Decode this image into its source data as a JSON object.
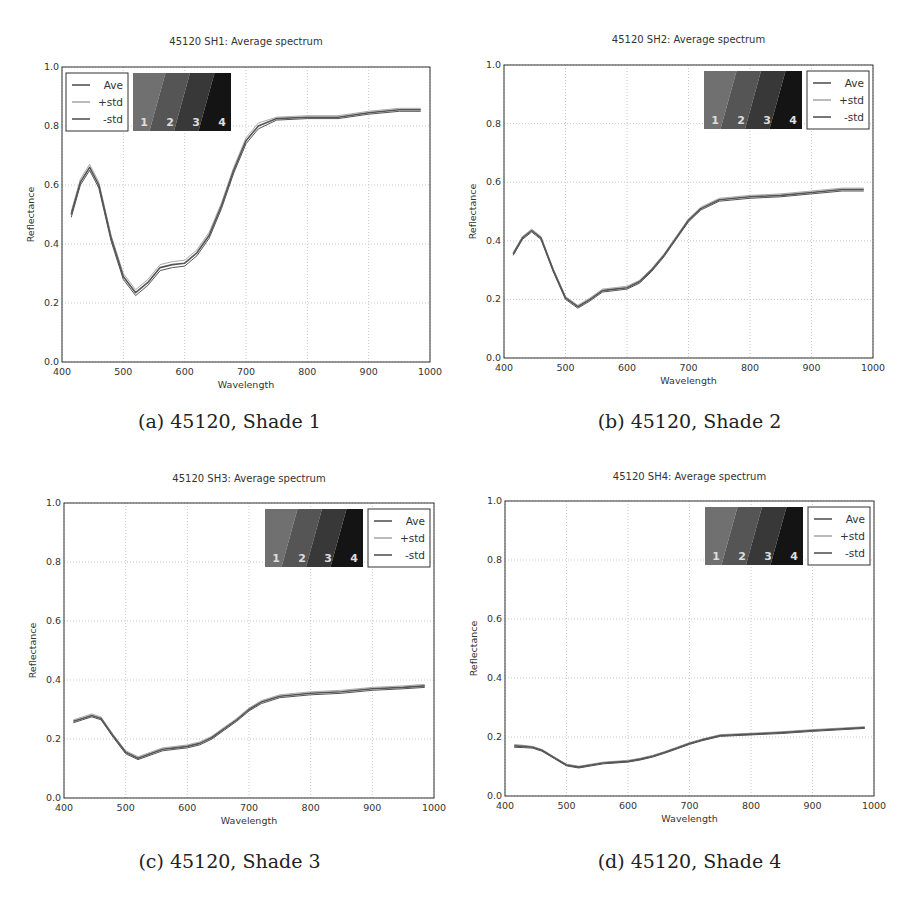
{
  "figure": {
    "panels": [
      {
        "caption": "(a) 45120, Shade 1"
      },
      {
        "caption": "(b) 45120, Shade 2"
      },
      {
        "caption": "(c) 45120, Shade 3"
      },
      {
        "caption": "(d) 45120, Shade 4"
      }
    ],
    "colors": {
      "line": "#555555",
      "std": "#aaaaaa",
      "grid": "#bbbbbb",
      "axis": "#333333",
      "swatch_light": "#6e6e6e",
      "swatch_dark": "#111111"
    }
  },
  "chart_data": [
    {
      "type": "line",
      "title": "45120 SH1: Average spectrum",
      "xlabel": "Wavelength",
      "ylabel": "Reflectance",
      "xlim": [
        400,
        1000
      ],
      "ylim": [
        0.0,
        1.0
      ],
      "xticks": [
        "400",
        "500",
        "600",
        "700",
        "800",
        "900",
        "1000"
      ],
      "yticks": [
        "0.0",
        "0.2",
        "0.4",
        "0.6",
        "0.8",
        "1.0"
      ],
      "grid": true,
      "legend": {
        "position": "upper left",
        "entries": [
          "Ave",
          "+std",
          "-std"
        ]
      },
      "swatch": {
        "position": "upper left",
        "labels": [
          "1",
          "2",
          "3",
          "4"
        ]
      },
      "x": [
        415,
        430,
        445,
        460,
        480,
        500,
        520,
        540,
        560,
        580,
        600,
        620,
        640,
        660,
        680,
        700,
        720,
        750,
        800,
        850,
        900,
        950,
        985
      ],
      "series": [
        {
          "name": "Ave",
          "values": [
            0.5,
            0.61,
            0.66,
            0.6,
            0.42,
            0.29,
            0.235,
            0.27,
            0.32,
            0.33,
            0.335,
            0.37,
            0.43,
            0.53,
            0.65,
            0.75,
            0.8,
            0.825,
            0.83,
            0.83,
            0.845,
            0.855,
            0.855
          ]
        },
        {
          "name": "+std",
          "values": [
            0.51,
            0.62,
            0.67,
            0.61,
            0.43,
            0.3,
            0.245,
            0.28,
            0.33,
            0.34,
            0.345,
            0.38,
            0.44,
            0.54,
            0.66,
            0.76,
            0.81,
            0.83,
            0.835,
            0.835,
            0.85,
            0.86,
            0.86
          ]
        },
        {
          "name": "-std",
          "values": [
            0.49,
            0.6,
            0.65,
            0.59,
            0.41,
            0.28,
            0.225,
            0.26,
            0.31,
            0.32,
            0.325,
            0.36,
            0.42,
            0.52,
            0.64,
            0.74,
            0.79,
            0.82,
            0.825,
            0.825,
            0.84,
            0.85,
            0.85
          ]
        }
      ]
    },
    {
      "type": "line",
      "title": "45120 SH2: Average spectrum",
      "xlabel": "Wavelength",
      "ylabel": "Reflectance",
      "xlim": [
        400,
        1000
      ],
      "ylim": [
        0.0,
        1.0
      ],
      "xticks": [
        "400",
        "500",
        "600",
        "700",
        "800",
        "900",
        "1000"
      ],
      "yticks": [
        "0.0",
        "0.2",
        "0.4",
        "0.6",
        "0.8",
        "1.0"
      ],
      "grid": true,
      "legend": {
        "position": "upper right",
        "entries": [
          "Ave",
          "+std",
          "-std"
        ]
      },
      "swatch": {
        "position": "upper right",
        "labels": [
          "1",
          "2",
          "3",
          "4"
        ]
      },
      "x": [
        415,
        430,
        445,
        460,
        480,
        500,
        520,
        540,
        560,
        580,
        600,
        620,
        640,
        660,
        680,
        700,
        720,
        750,
        800,
        850,
        900,
        950,
        985
      ],
      "series": [
        {
          "name": "Ave",
          "values": [
            0.355,
            0.41,
            0.435,
            0.41,
            0.3,
            0.205,
            0.175,
            0.2,
            0.23,
            0.235,
            0.24,
            0.26,
            0.3,
            0.35,
            0.41,
            0.47,
            0.51,
            0.54,
            0.55,
            0.555,
            0.565,
            0.575,
            0.575
          ]
        },
        {
          "name": "+std",
          "values": [
            0.36,
            0.415,
            0.44,
            0.415,
            0.305,
            0.21,
            0.18,
            0.205,
            0.235,
            0.24,
            0.245,
            0.265,
            0.305,
            0.355,
            0.415,
            0.475,
            0.515,
            0.545,
            0.555,
            0.56,
            0.57,
            0.58,
            0.58
          ]
        },
        {
          "name": "-std",
          "values": [
            0.35,
            0.405,
            0.43,
            0.405,
            0.295,
            0.2,
            0.17,
            0.195,
            0.225,
            0.23,
            0.235,
            0.255,
            0.295,
            0.345,
            0.405,
            0.465,
            0.505,
            0.535,
            0.545,
            0.55,
            0.56,
            0.57,
            0.57
          ]
        }
      ]
    },
    {
      "type": "line",
      "title": "45120 SH3: Average spectrum",
      "xlabel": "Wavelength",
      "ylabel": "Reflectance",
      "xlim": [
        400,
        1000
      ],
      "ylim": [
        0.0,
        1.0
      ],
      "xticks": [
        "400",
        "500",
        "600",
        "700",
        "800",
        "900",
        "1000"
      ],
      "yticks": [
        "0.0",
        "0.2",
        "0.4",
        "0.6",
        "0.8",
        "1.0"
      ],
      "grid": true,
      "legend": {
        "position": "upper right",
        "entries": [
          "Ave",
          "+std",
          "-std"
        ]
      },
      "swatch": {
        "position": "upper right",
        "labels": [
          "1",
          "2",
          "3",
          "4"
        ]
      },
      "x": [
        415,
        430,
        445,
        460,
        480,
        500,
        520,
        540,
        560,
        580,
        600,
        620,
        640,
        660,
        680,
        700,
        720,
        750,
        800,
        850,
        900,
        950,
        985
      ],
      "series": [
        {
          "name": "Ave",
          "values": [
            0.26,
            0.27,
            0.28,
            0.27,
            0.21,
            0.155,
            0.135,
            0.15,
            0.165,
            0.17,
            0.175,
            0.185,
            0.205,
            0.235,
            0.265,
            0.3,
            0.325,
            0.345,
            0.355,
            0.36,
            0.37,
            0.375,
            0.38
          ]
        },
        {
          "name": "+std",
          "values": [
            0.265,
            0.275,
            0.285,
            0.275,
            0.215,
            0.16,
            0.14,
            0.155,
            0.17,
            0.175,
            0.18,
            0.19,
            0.21,
            0.24,
            0.27,
            0.305,
            0.33,
            0.35,
            0.36,
            0.365,
            0.375,
            0.38,
            0.385
          ]
        },
        {
          "name": "-std",
          "values": [
            0.255,
            0.265,
            0.275,
            0.265,
            0.205,
            0.15,
            0.13,
            0.145,
            0.16,
            0.165,
            0.17,
            0.18,
            0.2,
            0.23,
            0.26,
            0.295,
            0.32,
            0.34,
            0.35,
            0.355,
            0.365,
            0.37,
            0.375
          ]
        }
      ]
    },
    {
      "type": "line",
      "title": "45120 SH4: Average spectrum",
      "xlabel": "Wavelength",
      "ylabel": "Reflectance",
      "xlim": [
        400,
        1000
      ],
      "ylim": [
        0.0,
        1.0
      ],
      "xticks": [
        "400",
        "500",
        "600",
        "700",
        "800",
        "900",
        "1000"
      ],
      "yticks": [
        "0.0",
        "0.2",
        "0.4",
        "0.6",
        "0.8",
        "1.0"
      ],
      "grid": true,
      "legend": {
        "position": "upper right",
        "entries": [
          "Ave",
          "+std",
          "-std"
        ]
      },
      "swatch": {
        "position": "upper right",
        "labels": [
          "1",
          "2",
          "3",
          "4"
        ]
      },
      "x": [
        415,
        430,
        445,
        460,
        480,
        500,
        520,
        540,
        560,
        580,
        600,
        620,
        640,
        660,
        680,
        700,
        720,
        750,
        800,
        850,
        900,
        950,
        985
      ],
      "series": [
        {
          "name": "Ave",
          "values": [
            0.17,
            0.168,
            0.165,
            0.155,
            0.13,
            0.105,
            0.098,
            0.105,
            0.112,
            0.115,
            0.118,
            0.125,
            0.135,
            0.148,
            0.163,
            0.178,
            0.19,
            0.205,
            0.21,
            0.215,
            0.222,
            0.228,
            0.232
          ]
        },
        {
          "name": "+std",
          "values": [
            0.175,
            0.172,
            0.168,
            0.158,
            0.133,
            0.108,
            0.101,
            0.108,
            0.115,
            0.118,
            0.121,
            0.128,
            0.138,
            0.151,
            0.166,
            0.181,
            0.193,
            0.208,
            0.213,
            0.218,
            0.225,
            0.231,
            0.235
          ]
        },
        {
          "name": "-std",
          "values": [
            0.165,
            0.164,
            0.162,
            0.152,
            0.127,
            0.102,
            0.095,
            0.102,
            0.109,
            0.112,
            0.115,
            0.122,
            0.132,
            0.145,
            0.16,
            0.175,
            0.187,
            0.202,
            0.207,
            0.212,
            0.219,
            0.225,
            0.229
          ]
        }
      ]
    }
  ]
}
